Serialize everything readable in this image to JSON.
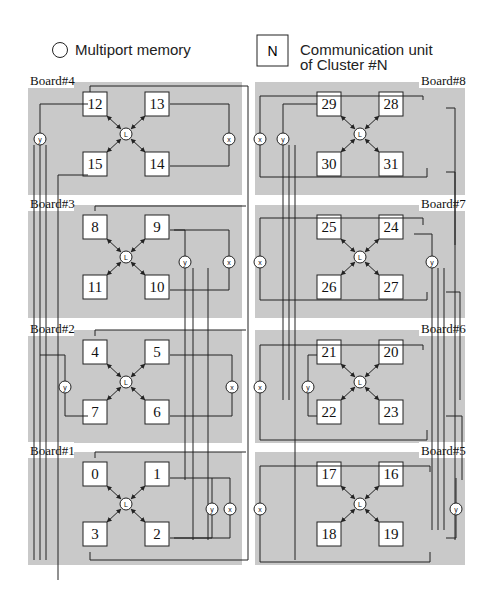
{
  "legend": {
    "memory_label": "Multiport memory",
    "cu_symbol": "N",
    "cu_label_line1": "Communication unit",
    "cu_label_line2": "of Cluster #N"
  },
  "memory_labels": {
    "local": "L",
    "x": "x",
    "y": "y"
  },
  "boards": [
    {
      "label": "Board#4",
      "units": [
        "12",
        "13",
        "15",
        "14"
      ]
    },
    {
      "label": "Board#3",
      "units": [
        "8",
        "9",
        "11",
        "10"
      ]
    },
    {
      "label": "Board#2",
      "units": [
        "4",
        "5",
        "7",
        "6"
      ]
    },
    {
      "label": "Board#1",
      "units": [
        "0",
        "1",
        "3",
        "2"
      ]
    },
    {
      "label": "Board#8",
      "units": [
        "29",
        "28",
        "30",
        "31"
      ]
    },
    {
      "label": "Board#7",
      "units": [
        "25",
        "24",
        "26",
        "27"
      ]
    },
    {
      "label": "Board#6",
      "units": [
        "21",
        "20",
        "22",
        "23"
      ]
    },
    {
      "label": "Board#5",
      "units": [
        "17",
        "16",
        "18",
        "19"
      ]
    }
  ],
  "colors": {
    "board": "#c9c9c9",
    "line": "#222222",
    "background": "#ffffff"
  }
}
